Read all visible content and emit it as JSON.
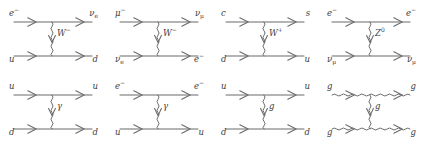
{
  "figure": {
    "kind": "feynman-diagram-grid",
    "columns": 4,
    "rows": 2,
    "background_color": "#ffffff",
    "line_color": "#6b6b6b",
    "text_color": "#3d3d3d"
  },
  "diagrams": [
    {
      "id": "weak-charged-current-electron-quark",
      "process": "e- u -> nu_e d",
      "interaction": "weak",
      "top_in": "e",
      "top_in_sup": "−",
      "top_in_sub": "",
      "top_out": "ν",
      "top_out_sup": "",
      "top_out_sub": "e",
      "bottom_in": "u",
      "bottom_in_sup": "",
      "bottom_in_sub": "",
      "bottom_out": "d",
      "bottom_out_sup": "",
      "bottom_out_sub": "",
      "boson": "W",
      "boson_sup": "−",
      "boson_style": "wavy",
      "top_line_style": "straight",
      "bottom_line_style": "straight"
    },
    {
      "id": "weak-charged-current-muon-neutrino",
      "process": "mu- nu_e -> nu_mu e-",
      "interaction": "weak",
      "top_in": "μ",
      "top_in_sup": "−",
      "top_in_sub": "",
      "top_out": "ν",
      "top_out_sup": "",
      "top_out_sub": "μ",
      "bottom_in": "ν",
      "bottom_in_sup": "",
      "bottom_in_sub": "e",
      "bottom_out": "e",
      "bottom_out_sup": "−",
      "bottom_out_sub": "",
      "boson": "W",
      "boson_sup": "−",
      "boson_style": "wavy",
      "top_line_style": "straight",
      "bottom_line_style": "straight"
    },
    {
      "id": "weak-charged-current-charm-down",
      "process": "c d -> s u",
      "interaction": "weak",
      "top_in": "c",
      "top_in_sup": "",
      "top_in_sub": "",
      "top_out": "s",
      "top_out_sup": "",
      "top_out_sub": "",
      "bottom_in": "d",
      "bottom_in_sup": "",
      "bottom_in_sub": "",
      "bottom_out": "u",
      "bottom_out_sup": "",
      "bottom_out_sub": "",
      "boson": "W",
      "boson_sup": "+",
      "boson_style": "wavy",
      "top_line_style": "straight",
      "bottom_line_style": "straight"
    },
    {
      "id": "weak-neutral-current-electron-neutrino",
      "process": "e- nu_mu -> e- nu_mu",
      "interaction": "weak-neutral",
      "top_in": "e",
      "top_in_sup": "−",
      "top_in_sub": "",
      "top_out": "e",
      "top_out_sup": "−",
      "top_out_sub": "",
      "bottom_in": "ν",
      "bottom_in_sup": "",
      "bottom_in_sub": "μ",
      "bottom_out": "ν",
      "bottom_out_sup": "",
      "bottom_out_sub": "μ",
      "boson": "Z",
      "boson_sup": "0",
      "boson_style": "wavy",
      "top_line_style": "straight",
      "bottom_line_style": "straight"
    },
    {
      "id": "electromagnetic-up-down",
      "process": "u d -> u d",
      "interaction": "electromagnetic",
      "top_in": "u",
      "top_in_sup": "",
      "top_in_sub": "",
      "top_out": "u",
      "top_out_sup": "",
      "top_out_sub": "",
      "bottom_in": "d",
      "bottom_in_sup": "",
      "bottom_in_sub": "",
      "bottom_out": "d",
      "bottom_out_sup": "",
      "bottom_out_sub": "",
      "boson": "γ",
      "boson_sup": "",
      "boson_style": "wavy",
      "top_line_style": "straight",
      "bottom_line_style": "straight"
    },
    {
      "id": "electromagnetic-electron-up",
      "process": "e- u -> e- u",
      "interaction": "electromagnetic",
      "top_in": "e",
      "top_in_sup": "−",
      "top_in_sub": "",
      "top_out": "e",
      "top_out_sup": "−",
      "top_out_sub": "",
      "bottom_in": "u",
      "bottom_in_sup": "",
      "bottom_in_sub": "",
      "bottom_out": "u",
      "bottom_out_sup": "",
      "bottom_out_sub": "",
      "boson": "γ",
      "boson_sup": "",
      "boson_style": "wavy",
      "top_line_style": "straight",
      "bottom_line_style": "straight"
    },
    {
      "id": "strong-up-down-gluon",
      "process": "u d -> u d",
      "interaction": "strong",
      "top_in": "u",
      "top_in_sup": "",
      "top_in_sub": "",
      "top_out": "u",
      "top_out_sup": "",
      "top_out_sub": "",
      "bottom_in": "d",
      "bottom_in_sup": "",
      "bottom_in_sub": "",
      "bottom_out": "d",
      "bottom_out_sup": "",
      "bottom_out_sub": "",
      "boson": "g",
      "boson_sup": "",
      "boson_style": "wavy",
      "top_line_style": "straight",
      "bottom_line_style": "straight"
    },
    {
      "id": "strong-gluon-self-interaction",
      "process": "g g -> g g",
      "interaction": "strong",
      "top_in": "g",
      "top_in_sup": "",
      "top_in_sub": "",
      "top_out": "g",
      "top_out_sup": "",
      "top_out_sub": "",
      "bottom_in": "g",
      "bottom_in_sup": "",
      "bottom_in_sub": "",
      "bottom_out": "g",
      "bottom_out_sup": "",
      "bottom_out_sub": "",
      "boson": "g",
      "boson_sup": "",
      "boson_style": "wavy",
      "top_line_style": "wavy",
      "bottom_line_style": "wavy"
    }
  ]
}
